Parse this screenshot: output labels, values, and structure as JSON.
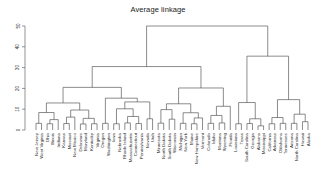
{
  "chart_data": {
    "type": "dendrogram",
    "title": "Average linkage",
    "xlabel": "",
    "ylabel": "",
    "ylim": [
      0,
      53
    ],
    "yticks": [
      0,
      10,
      20,
      30,
      40,
      50
    ],
    "ytick_labels": [
      "0",
      "10",
      "20",
      "30",
      "40",
      "50"
    ],
    "grid": false,
    "legend": "none",
    "linkage_method": "average",
    "n_leaves": 50,
    "leaf_labels": [
      "New Jersey",
      "West Virginia",
      "Ohio",
      "Illinois",
      "Indiana",
      "Kansas",
      "Missouri",
      "New Mexico",
      "Delaware",
      "Maryland",
      "Kentucky",
      "Virginia",
      "Oregon",
      "Washington",
      "Iowa",
      "Nebraska",
      "Rhode Island",
      "Massachusetts",
      "Connecticut",
      "Pennsylvania",
      "Nevada",
      "Utah",
      "Minnesota",
      "North Dakota",
      "South Dakota",
      "Wisconsin",
      "Michigan",
      "New York",
      "Maine",
      "New Hampshire",
      "Vermont",
      "Colorado",
      "Idaho",
      "Montana",
      "Wyoming",
      "Florida",
      "Louisiana",
      "Texas",
      "South Carolina",
      "Georgia",
      "Alabama",
      "Mississippi",
      "California",
      "Arkansas",
      "Oklahoma",
      "Tennessee",
      "Arizona",
      "North Carolina",
      "Hawaii",
      "Alaska"
    ],
    "merges": [
      {
        "id": 50,
        "a": {
          "t": "leaf",
          "i": 0
        },
        "b": {
          "t": "leaf",
          "i": 1
        },
        "h": 3.2
      },
      {
        "id": 51,
        "a": {
          "t": "leaf",
          "i": 2
        },
        "b": {
          "t": "leaf",
          "i": 3
        },
        "h": 3.0
      },
      {
        "id": 52,
        "a": {
          "t": "node",
          "i": 51
        },
        "b": {
          "t": "leaf",
          "i": 4
        },
        "h": 5.0
      },
      {
        "id": 53,
        "a": {
          "t": "node",
          "i": 50
        },
        "b": {
          "t": "node",
          "i": 52
        },
        "h": 8.4
      },
      {
        "id": 54,
        "a": {
          "t": "leaf",
          "i": 5
        },
        "b": {
          "t": "leaf",
          "i": 6
        },
        "h": 3.1
      },
      {
        "id": 55,
        "a": {
          "t": "node",
          "i": 54
        },
        "b": {
          "t": "leaf",
          "i": 7
        },
        "h": 6.2
      },
      {
        "id": 56,
        "a": {
          "t": "leaf",
          "i": 8
        },
        "b": {
          "t": "leaf",
          "i": 9
        },
        "h": 2.9
      },
      {
        "id": 57,
        "a": {
          "t": "leaf",
          "i": 10
        },
        "b": {
          "t": "leaf",
          "i": 11
        },
        "h": 3.0
      },
      {
        "id": 58,
        "a": {
          "t": "node",
          "i": 56
        },
        "b": {
          "t": "node",
          "i": 57
        },
        "h": 5.6
      },
      {
        "id": 59,
        "a": {
          "t": "node",
          "i": 55
        },
        "b": {
          "t": "node",
          "i": 58
        },
        "h": 9.6
      },
      {
        "id": 60,
        "a": {
          "t": "node",
          "i": 53
        },
        "b": {
          "t": "node",
          "i": 59
        },
        "h": 13.0
      },
      {
        "id": 61,
        "a": {
          "t": "leaf",
          "i": 12
        },
        "b": {
          "t": "leaf",
          "i": 13
        },
        "h": 3.2
      },
      {
        "id": 62,
        "a": {
          "t": "leaf",
          "i": 14
        },
        "b": {
          "t": "leaf",
          "i": 15
        },
        "h": 3.0
      },
      {
        "id": 63,
        "a": {
          "t": "leaf",
          "i": 16
        },
        "b": {
          "t": "leaf",
          "i": 17
        },
        "h": 3.4
      },
      {
        "id": 64,
        "a": {
          "t": "leaf",
          "i": 18
        },
        "b": {
          "t": "leaf",
          "i": 19
        },
        "h": 3.1
      },
      {
        "id": 65,
        "a": {
          "t": "node",
          "i": 63
        },
        "b": {
          "t": "node",
          "i": 64
        },
        "h": 6.5
      },
      {
        "id": 66,
        "a": {
          "t": "node",
          "i": 62
        },
        "b": {
          "t": "node",
          "i": 65
        },
        "h": 10.2
      },
      {
        "id": 67,
        "a": {
          "t": "leaf",
          "i": 20
        },
        "b": {
          "t": "leaf",
          "i": 21
        },
        "h": 5.4
      },
      {
        "id": 68,
        "a": {
          "t": "node",
          "i": 66
        },
        "b": {
          "t": "node",
          "i": 67
        },
        "h": 13.5
      },
      {
        "id": 69,
        "a": {
          "t": "node",
          "i": 61
        },
        "b": {
          "t": "node",
          "i": 68
        },
        "h": 15.3
      },
      {
        "id": 70,
        "a": {
          "t": "node",
          "i": 60
        },
        "b": {
          "t": "node",
          "i": 69
        },
        "h": 20.5
      },
      {
        "id": 71,
        "a": {
          "t": "leaf",
          "i": 22
        },
        "b": {
          "t": "leaf",
          "i": 23
        },
        "h": 3.3
      },
      {
        "id": 72,
        "a": {
          "t": "leaf",
          "i": 24
        },
        "b": {
          "t": "leaf",
          "i": 25
        },
        "h": 5.2
      },
      {
        "id": 73,
        "a": {
          "t": "node",
          "i": 71
        },
        "b": {
          "t": "node",
          "i": 72
        },
        "h": 9.8
      },
      {
        "id": 74,
        "a": {
          "t": "leaf",
          "i": 26
        },
        "b": {
          "t": "leaf",
          "i": 27
        },
        "h": 3.2
      },
      {
        "id": 75,
        "a": {
          "t": "leaf",
          "i": 28
        },
        "b": {
          "t": "leaf",
          "i": 29
        },
        "h": 3.0
      },
      {
        "id": 76,
        "a": {
          "t": "leaf",
          "i": 30
        },
        "b": {
          "t": "node",
          "i": 75
        },
        "h": 5.8
      },
      {
        "id": 77,
        "a": {
          "t": "node",
          "i": 74
        },
        "b": {
          "t": "node",
          "i": 76
        },
        "h": 8.3
      },
      {
        "id": 78,
        "a": {
          "t": "node",
          "i": 73
        },
        "b": {
          "t": "node",
          "i": 77
        },
        "h": 12.6
      },
      {
        "id": 79,
        "a": {
          "t": "leaf",
          "i": 31
        },
        "b": {
          "t": "leaf",
          "i": 32
        },
        "h": 3.2
      },
      {
        "id": 80,
        "a": {
          "t": "leaf",
          "i": 33
        },
        "b": {
          "t": "leaf",
          "i": 34
        },
        "h": 3.4
      },
      {
        "id": 81,
        "a": {
          "t": "node",
          "i": 79
        },
        "b": {
          "t": "node",
          "i": 80
        },
        "h": 7.0
      },
      {
        "id": 82,
        "a": {
          "t": "node",
          "i": 81
        },
        "b": {
          "t": "leaf",
          "i": 35
        },
        "h": 11.4
      },
      {
        "id": 83,
        "a": {
          "t": "node",
          "i": 78
        },
        "b": {
          "t": "node",
          "i": 82
        },
        "h": 20.2
      },
      {
        "id": 84,
        "a": {
          "t": "node",
          "i": 70
        },
        "b": {
          "t": "node",
          "i": 83
        },
        "h": 30.5
      },
      {
        "id": 85,
        "a": {
          "t": "leaf",
          "i": 36
        },
        "b": {
          "t": "leaf",
          "i": 37
        },
        "h": 3.0
      },
      {
        "id": 86,
        "a": {
          "t": "leaf",
          "i": 38
        },
        "b": {
          "t": "leaf",
          "i": 39
        },
        "h": 3.1
      },
      {
        "id": 87,
        "a": {
          "t": "leaf",
          "i": 40
        },
        "b": {
          "t": "leaf",
          "i": 41
        },
        "h": 2.0
      },
      {
        "id": 88,
        "a": {
          "t": "node",
          "i": 86
        },
        "b": {
          "t": "node",
          "i": 87
        },
        "h": 5.4
      },
      {
        "id": 89,
        "a": {
          "t": "node",
          "i": 85
        },
        "b": {
          "t": "node",
          "i": 88
        },
        "h": 13.2
      },
      {
        "id": 90,
        "a": {
          "t": "leaf",
          "i": 42
        },
        "b": {
          "t": "leaf",
          "i": 43
        },
        "h": 3.0
      },
      {
        "id": 91,
        "a": {
          "t": "leaf",
          "i": 44
        },
        "b": {
          "t": "leaf",
          "i": 45
        },
        "h": 3.2
      },
      {
        "id": 92,
        "a": {
          "t": "node",
          "i": 90
        },
        "b": {
          "t": "node",
          "i": 91
        },
        "h": 6.0
      },
      {
        "id": 93,
        "a": {
          "t": "leaf",
          "i": 46
        },
        "b": {
          "t": "leaf",
          "i": 47
        },
        "h": 3.2
      },
      {
        "id": 94,
        "a": {
          "t": "leaf",
          "i": 48
        },
        "b": {
          "t": "leaf",
          "i": 49
        },
        "h": 4.0
      },
      {
        "id": 95,
        "a": {
          "t": "node",
          "i": 93
        },
        "b": {
          "t": "node",
          "i": 94
        },
        "h": 7.6
      },
      {
        "id": 96,
        "a": {
          "t": "node",
          "i": 92
        },
        "b": {
          "t": "node",
          "i": 95
        },
        "h": 14.6
      },
      {
        "id": 97,
        "a": {
          "t": "node",
          "i": 89
        },
        "b": {
          "t": "node",
          "i": 96
        },
        "h": 35.5
      },
      {
        "id": 98,
        "a": {
          "t": "node",
          "i": 84
        },
        "b": {
          "t": "node",
          "i": 97
        },
        "h": 50.0
      }
    ],
    "line_color": "#4d4d4d",
    "text_color": "#2b2b2b",
    "background": "#ffffff"
  }
}
